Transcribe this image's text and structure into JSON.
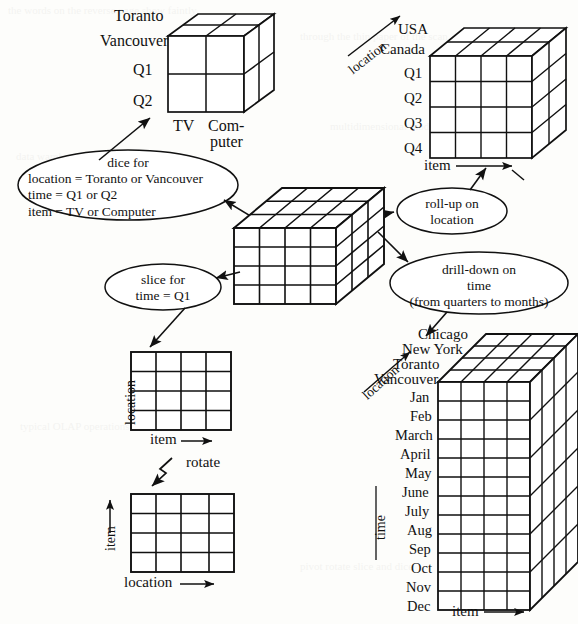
{
  "figure": {
    "type": "diagram"
  },
  "dice_cube": {
    "name": "dice-result-cube",
    "top_labels": [
      "Toranto",
      "Vancouver"
    ],
    "row_labels": [
      "Q1",
      "Q2"
    ],
    "col_labels": [
      "TV",
      "Com-",
      "puter"
    ],
    "columns": 2,
    "rows": 2,
    "depth": 2
  },
  "dice_note": {
    "lines": [
      "dice for",
      "location = Toranto or Vancouver",
      "time = Q1 or Q2",
      "item = TV or Computer"
    ]
  },
  "rollup_cube": {
    "name": "rollup-result-cube",
    "axis_label": "location",
    "top_labels": [
      "USA",
      "Canada"
    ],
    "row_labels": [
      "Q1",
      "Q2",
      "Q3",
      "Q4"
    ],
    "x_axis": "item",
    "columns": 4,
    "rows": 4,
    "depth": 2
  },
  "rollup_note": {
    "lines": [
      "roll-up on",
      "location"
    ]
  },
  "center_cube": {
    "name": "central-data-cube",
    "columns": 4,
    "rows": 4,
    "depth": 3
  },
  "slice_note": {
    "lines": [
      "slice for",
      "time = Q1"
    ]
  },
  "slice_grid": {
    "name": "slice-result-grid",
    "y_axis": "location",
    "x_axis": "item",
    "x_arrow": "→",
    "columns": 4,
    "rows": 4
  },
  "rotate": {
    "label": "rotate"
  },
  "rotate_grid": {
    "name": "rotate-result-grid",
    "y_axis": "item",
    "x_axis": "location",
    "x_arrow": "→",
    "columns": 4,
    "rows": 4
  },
  "drill_note": {
    "lines": [
      "drill-down on",
      "time",
      "(from quarters to months)"
    ]
  },
  "drill_cube": {
    "name": "drilldown-result-cube",
    "axis_label": "location",
    "top_labels": [
      "Chicago",
      "New York",
      "Toranto",
      "Vancouver"
    ],
    "y_axis": "time",
    "row_labels": [
      "Jan",
      "Feb",
      "March",
      "April",
      "May",
      "June",
      "July",
      "Aug",
      "Sep",
      "Oct",
      "Nov",
      "Dec"
    ],
    "x_axis": "item",
    "x_arrow": "→",
    "columns": 4,
    "rows": 12,
    "depth": 4
  },
  "colors": {
    "ink": "#111111",
    "paper": "#fdfdfb",
    "ghost_text": "#7a7a72"
  }
}
